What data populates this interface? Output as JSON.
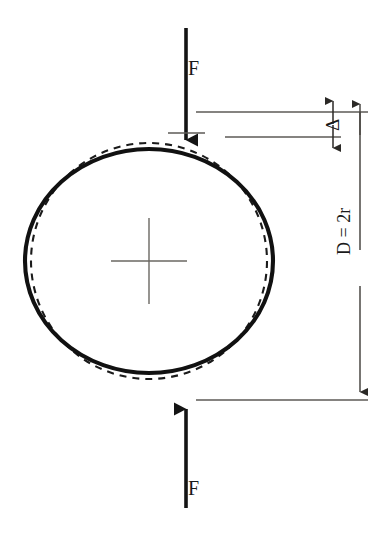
{
  "figure": {
    "background_color": "#ffffff",
    "ink_color": "#141414",
    "thin_line_color": "#55524f",
    "canvas": {
      "width": 378,
      "height": 539
    }
  },
  "labels": {
    "force_top": "F",
    "force_bottom": "F",
    "deflection": "Δ",
    "diameter": "D = 2r"
  },
  "geometry": {
    "center": {
      "x": 149,
      "y": 261
    },
    "undeformed_circle": {
      "style": "dashed",
      "radius_x": 118,
      "radius_y": 118,
      "dash_pattern": "7 6"
    },
    "deformed_shape": {
      "style": "solid",
      "radius_x": 124,
      "radius_y": 112,
      "stroke_width": 4
    },
    "center_mark": {
      "type": "crosshair",
      "half_width": 38,
      "half_height": 43
    }
  },
  "arrows": {
    "top_force": {
      "direction": "down",
      "tail_y": 28,
      "head_y": 149,
      "x": 186,
      "head_width": 19,
      "head_length": 22
    },
    "bottom_force": {
      "direction": "up",
      "tail_y": 508,
      "head_y": 399,
      "x": 186,
      "head_width": 19,
      "head_length": 22
    }
  },
  "dimensions": {
    "delta": {
      "label": "Δ",
      "line_x": 333,
      "upper_y": 112,
      "lower_y": 137,
      "arrow_style": "outward",
      "extension_top_from_x": 196,
      "extension_bottom_from_x": 225
    },
    "diameter": {
      "label": "D = 2r",
      "line_x": 360,
      "top_y": 112,
      "bottom_y": 400,
      "arrow_style": "inward",
      "extension_top_from_x": 196,
      "extension_bottom_from_x": 196
    }
  },
  "annotations": {
    "meaning_solid": "deformed ring under load",
    "meaning_dashed": "original undeformed circle"
  }
}
